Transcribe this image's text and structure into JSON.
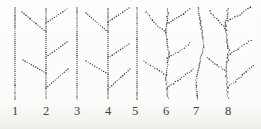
{
  "figure": {
    "width": 261,
    "height": 129,
    "background": "#fdfdfc",
    "dot_color": "#2e2b27",
    "label_color": "#44413c",
    "trees": [
      {
        "label": "1",
        "label_x": 15,
        "jitter": 0,
        "trunk": [
          [
            15,
            8
          ],
          [
            15,
            99
          ]
        ],
        "branches": []
      },
      {
        "label": "2",
        "label_x": 46,
        "jitter": 0,
        "trunk": [
          [
            46,
            9
          ],
          [
            46,
            98
          ]
        ],
        "branches": [
          [
            [
              46,
              23
            ],
            [
              67,
              9
            ]
          ],
          [
            [
              46,
              32
            ],
            [
              22,
              12
            ]
          ],
          [
            [
              46,
              57
            ],
            [
              67,
              42
            ]
          ],
          [
            [
              46,
              73
            ],
            [
              23,
              60
            ]
          ],
          [
            [
              46,
              88
            ],
            [
              68,
              69
            ]
          ]
        ]
      },
      {
        "label": "3",
        "label_x": 77,
        "jitter": 0,
        "trunk": [
          [
            77,
            8
          ],
          [
            77,
            99
          ]
        ],
        "branches": []
      },
      {
        "label": "4",
        "label_x": 108,
        "jitter": 0,
        "trunk": [
          [
            108,
            9
          ],
          [
            108,
            98
          ]
        ],
        "branches": [
          [
            [
              108,
              22
            ],
            [
              129,
              8
            ]
          ],
          [
            [
              108,
              32
            ],
            [
              86,
              13
            ]
          ],
          [
            [
              108,
              58
            ],
            [
              129,
              44
            ]
          ],
          [
            [
              108,
              74
            ],
            [
              86,
              61
            ]
          ],
          [
            [
              108,
              89
            ],
            [
              130,
              69
            ]
          ]
        ]
      },
      {
        "label": "5",
        "label_x": 135,
        "jitter": 0,
        "trunk": [
          [
            137,
            8
          ],
          [
            137,
            99
          ]
        ],
        "branches": []
      },
      {
        "label": "6",
        "label_x": 166,
        "jitter": 0.6,
        "trunk": [
          [
            168,
            9
          ],
          [
            166,
            32
          ],
          [
            169,
            55
          ],
          [
            166,
            76
          ],
          [
            168,
            98
          ]
        ],
        "branches": [
          [
            [
              167,
              24
            ],
            [
              179,
              17
            ],
            [
              190,
              9
            ]
          ],
          [
            [
              166,
              33
            ],
            [
              156,
              24
            ],
            [
              146,
              12
            ]
          ],
          [
            [
              167,
              58
            ],
            [
              180,
              51
            ],
            [
              190,
              43
            ]
          ],
          [
            [
              166,
              75
            ],
            [
              155,
              68
            ],
            [
              144,
              61
            ]
          ],
          [
            [
              167,
              88
            ],
            [
              180,
              79
            ],
            [
              193,
              69
            ]
          ]
        ]
      },
      {
        "label": "7",
        "label_x": 196,
        "jitter": 0.55,
        "trunk": [
          [
            198,
            8
          ],
          [
            201,
            25
          ],
          [
            204,
            45
          ],
          [
            199,
            65
          ],
          [
            196,
            82
          ],
          [
            197,
            99
          ]
        ],
        "branches": []
      },
      {
        "label": "8",
        "label_x": 228,
        "jitter": 0.8,
        "trunk": [
          [
            228,
            9
          ],
          [
            225,
            28
          ],
          [
            229,
            50
          ],
          [
            226,
            72
          ],
          [
            228,
            98
          ]
        ],
        "branches": [
          [
            [
              228,
              21
            ],
            [
              240,
              15
            ],
            [
              250,
              7
            ]
          ],
          [
            [
              227,
              30
            ],
            [
              218,
              21
            ],
            [
              210,
              11
            ]
          ],
          [
            [
              228,
              55
            ],
            [
              240,
              48
            ],
            [
              251,
              40
            ]
          ],
          [
            [
              227,
              71
            ],
            [
              217,
              65
            ],
            [
              207,
              58
            ]
          ],
          [
            [
              228,
              87
            ],
            [
              241,
              77
            ],
            [
              253,
              65
            ]
          ]
        ]
      }
    ]
  }
}
